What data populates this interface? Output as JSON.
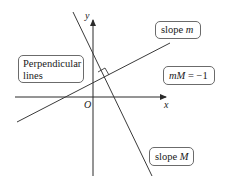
{
  "diagram": {
    "title": "Perpendicular lines",
    "axes": {
      "x_label": "x",
      "y_label": "y",
      "origin_label": "O"
    },
    "callouts": {
      "perpendicular": {
        "line1": "Perpendicular",
        "line2": "lines"
      },
      "slope_m": {
        "prefix": "slope ",
        "var": "m"
      },
      "slope_M": {
        "prefix": "slope ",
        "var": "M"
      },
      "relation": {
        "lhs": "mM",
        "eq": " = ",
        "rhs": "−1"
      }
    },
    "colors": {
      "line": "#3a3a3a",
      "axis": "#2a2a2a",
      "box_border": "#6b6b6b",
      "background": "#ffffff"
    }
  }
}
